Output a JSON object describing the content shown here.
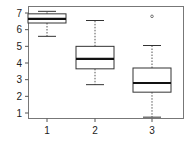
{
  "chart_data": {
    "type": "box",
    "title": "",
    "xlabel": "",
    "ylabel": "",
    "categories": [
      "1",
      "2",
      "3"
    ],
    "ylim": [
      0.6,
      7.4
    ],
    "yticks": [
      1,
      2,
      3,
      4,
      5,
      6,
      7
    ],
    "grid": false,
    "boxes": [
      {
        "category": "1",
        "whisker_low": 5.6,
        "q1": 6.4,
        "median": 6.65,
        "q3": 6.95,
        "whisker_high": 7.1,
        "outliers": []
      },
      {
        "category": "2",
        "whisker_low": 2.7,
        "q1": 3.65,
        "median": 4.25,
        "q3": 5.0,
        "whisker_high": 6.55,
        "outliers": []
      },
      {
        "category": "3",
        "whisker_low": 0.75,
        "q1": 2.25,
        "median": 2.8,
        "q3": 3.7,
        "whisker_high": 5.05,
        "outliers": [
          6.8
        ]
      }
    ]
  },
  "colors": {
    "axis": "#555555",
    "box": "#333333",
    "median": "#111111",
    "whisker": "#555555"
  }
}
